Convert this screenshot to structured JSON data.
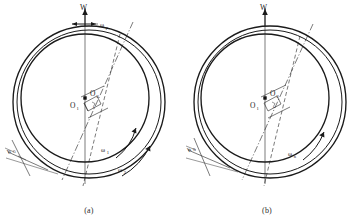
{
  "figure": {
    "type": "engineering-diagram",
    "panels": [
      {
        "id": "a",
        "caption": "(a)",
        "labels": {
          "load": "W",
          "center_inner": "O",
          "center_inner_sub": "1",
          "center_outer": "O",
          "center_outer_sub": "2",
          "eccentricity": "e",
          "gap": "h",
          "gap_sub": "0",
          "omega_p": "ω",
          "omega_p_sub": "p",
          "omega_1": "ω",
          "omega_1_sub": "1",
          "omega_2": "ω",
          "omega_2_sub": "2"
        }
      },
      {
        "id": "b",
        "caption": "(b)",
        "labels": {
          "load": "W",
          "center_inner": "O",
          "center_inner_sub": "1",
          "center_outer": "O",
          "center_outer_sub": "2",
          "eccentricity": "e",
          "gap": "h",
          "gap_sub": "0",
          "omega_n": "ω",
          "omega_n_sub": "n"
        }
      }
    ],
    "colors": {
      "ink": "#1a1a1a",
      "background": "#ffffff",
      "light_ink": "#333333"
    }
  }
}
